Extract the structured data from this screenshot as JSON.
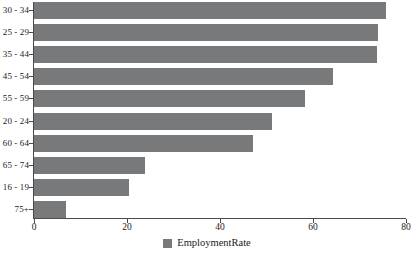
{
  "chart_data": {
    "type": "bar",
    "orientation": "horizontal",
    "title": "",
    "xlabel": "",
    "ylabel": "",
    "categories": [
      "30 - 34",
      "25 - 29",
      "35 - 44",
      "45 - 54",
      "55 - 59",
      "20 - 24",
      "60 - 64",
      "65 - 74",
      "16 - 19",
      "75+"
    ],
    "values": [
      75.7,
      74.0,
      73.8,
      64.3,
      58.3,
      51.2,
      47.0,
      23.8,
      20.4,
      6.9
    ],
    "series": [
      {
        "name": "EmploymentRate",
        "color": "#77797a",
        "values": [
          75.7,
          74.0,
          73.8,
          64.3,
          58.3,
          51.2,
          47.0,
          23.8,
          20.4,
          6.9
        ]
      }
    ],
    "xlim": [
      0,
      80
    ],
    "xticks": [
      0,
      20,
      40,
      60,
      80
    ],
    "xtick_labels": [
      "0",
      "20",
      "40",
      "60",
      "80"
    ],
    "grid": false,
    "legend": {
      "position": "bottom",
      "entries": [
        {
          "label": "EmploymentRate",
          "color": "#77797a"
        }
      ]
    }
  }
}
